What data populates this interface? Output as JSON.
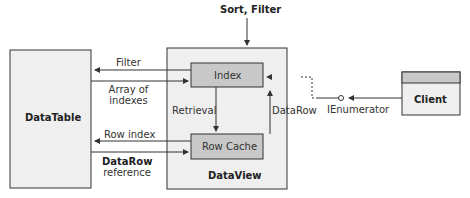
{
  "diagram": {
    "top_label": "Sort, Filter",
    "datatable": {
      "label": "DataTable"
    },
    "dataview": {
      "label": "DataView"
    },
    "index_box": {
      "label": "Index"
    },
    "rowcache_box": {
      "label": "Row Cache"
    },
    "client_box": {
      "label": "Client"
    },
    "arrows": {
      "filter": "Filter",
      "array_of_indexes_1": "Array of",
      "array_of_indexes_2": "indexes",
      "row_index": "Row index",
      "datarow_ref_1": "DataRow",
      "datarow_ref_2": "reference",
      "retrieval": "Retrieval",
      "datarow": "DataRow",
      "ienumerator": "IEnumerator"
    },
    "colors": {
      "panel_fill": "#efefef",
      "inner_box_fill": "#c8c8c8",
      "client_header_fill": "#c8c8c8",
      "stroke": "#333333"
    }
  }
}
